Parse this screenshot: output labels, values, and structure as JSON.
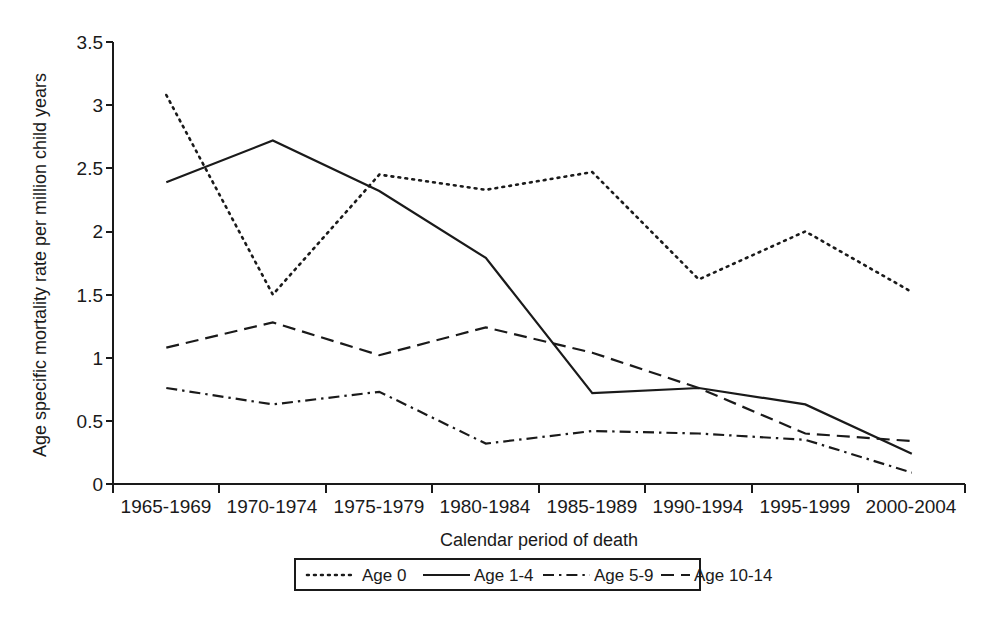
{
  "chart_data": {
    "type": "line",
    "title": "",
    "xlabel": "Calendar period of death",
    "ylabel": "Age specific mortality rate per million child years",
    "categories": [
      "1965-1969",
      "1970-1974",
      "1975-1979",
      "1980-1984",
      "1985-1989",
      "1990-1994",
      "1995-1999",
      "2000-2004"
    ],
    "ylim": [
      0,
      3.5
    ],
    "yticks": [
      "0",
      "0.5",
      "1",
      "1.5",
      "2",
      "2.5",
      "3",
      "3.5"
    ],
    "ytick_values": [
      0,
      0.5,
      1,
      1.5,
      2,
      2.5,
      3,
      3.5
    ],
    "grid": false,
    "legend_position": "bottom",
    "series": [
      {
        "name": "Age 0",
        "line_style": "dotted",
        "values": [
          3.08,
          1.5,
          2.45,
          2.33,
          2.47,
          1.62,
          2.0,
          1.52
        ]
      },
      {
        "name": "Age 1-4",
        "line_style": "solid",
        "values": [
          2.39,
          2.72,
          2.32,
          1.79,
          0.72,
          0.76,
          0.63,
          0.24
        ]
      },
      {
        "name": "Age 5-9",
        "line_style": "dash-dot",
        "values": [
          0.76,
          0.63,
          0.73,
          0.32,
          0.42,
          0.4,
          0.35,
          0.09
        ]
      },
      {
        "name": "Age 10-14",
        "line_style": "dashed",
        "values": [
          1.08,
          1.28,
          1.02,
          1.24,
          1.04,
          0.76,
          0.4,
          0.34
        ]
      }
    ]
  },
  "colors": {
    "ink": "#1a1a1a",
    "background": "#ffffff"
  }
}
